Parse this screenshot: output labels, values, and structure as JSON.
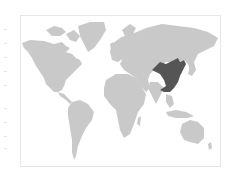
{
  "map": {
    "type": "world-choropleth",
    "highlighted_regions": [
      "China"
    ],
    "colors": {
      "land": "#c9c9c9",
      "highlight": "#555555",
      "frame": "#e6e6e6",
      "background": "#ffffff"
    }
  }
}
